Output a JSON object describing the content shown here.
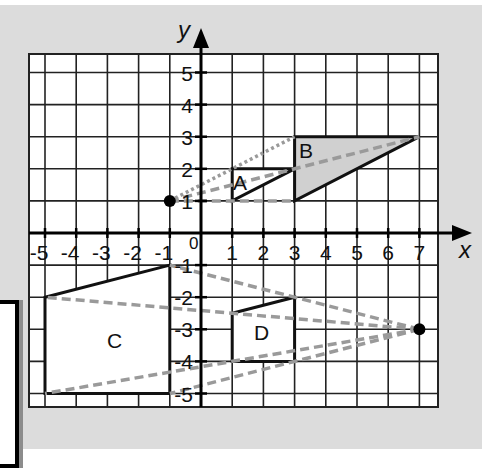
{
  "chart_data": {
    "type": "diagram",
    "axes": {
      "x_label": "x",
      "y_label": "y",
      "origin_label": "0",
      "x_ticks": [
        "-5",
        "-4",
        "-3",
        "-2",
        "-1",
        "1",
        "2",
        "3",
        "4",
        "5",
        "6",
        "7"
      ],
      "y_ticks": [
        "5",
        "4",
        "3",
        "2",
        "1",
        "-1",
        "-2",
        "-3",
        "-4",
        "-5"
      ],
      "xlim": [
        -5.5,
        7.5
      ],
      "ylim": [
        -5.5,
        5.5
      ],
      "grid": true
    },
    "shapes": [
      {
        "label": "A",
        "vertices": [
          [
            1,
            1
          ],
          [
            1,
            2
          ],
          [
            3,
            2
          ]
        ],
        "fill": "#ffffff"
      },
      {
        "label": "B",
        "vertices": [
          [
            3,
            1
          ],
          [
            3,
            3
          ],
          [
            7,
            3
          ]
        ],
        "fill": "#d0d0d0"
      },
      {
        "label": "C",
        "vertices": [
          [
            -5,
            -2
          ],
          [
            -1,
            -1
          ],
          [
            -1,
            -5
          ],
          [
            -5,
            -5
          ]
        ],
        "fill": "#ffffff"
      },
      {
        "label": "D",
        "vertices": [
          [
            1,
            -2.5
          ],
          [
            3,
            -2
          ],
          [
            3,
            -4
          ],
          [
            1,
            -4
          ]
        ],
        "fill": "#ffffff"
      }
    ],
    "centres": [
      {
        "name": "centre-AB",
        "point": [
          -1,
          1
        ]
      },
      {
        "name": "centre-CD",
        "point": [
          7,
          -3
        ]
      }
    ],
    "ray_color": "#9a9a9a"
  },
  "labels": {
    "x": "x",
    "y": "y",
    "origin": "0",
    "A": "A",
    "B": "B",
    "C": "C",
    "D": "D"
  }
}
